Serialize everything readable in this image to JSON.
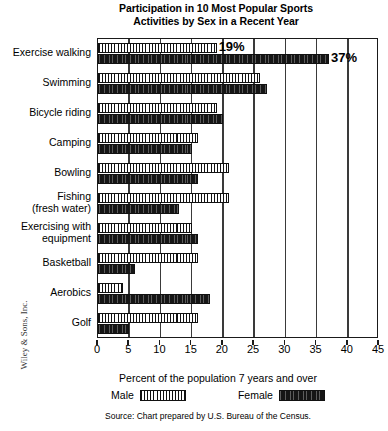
{
  "title_line1": "Participation in 10 Most Popular Sports",
  "title_line2": "Activities by Sex in a Recent Year",
  "axis": {
    "xlabel": "Percent of the population 7 years and over",
    "ticks": [
      "0",
      "5",
      "10",
      "15",
      "20",
      "25",
      "30",
      "35",
      "40",
      "45"
    ]
  },
  "legend": {
    "male_label": "Male",
    "female_label": "Female"
  },
  "source": "Source: Chart prepared by U.S. Bureau of the Census.",
  "credit": "Wiley & Sons, Inc.",
  "annotations": {
    "male_walking": "19%",
    "female_walking": "37%"
  },
  "categories_display": [
    {
      "line1": "Exercise walking",
      "line2": ""
    },
    {
      "line1": "Swimming",
      "line2": ""
    },
    {
      "line1": "Bicycle riding",
      "line2": ""
    },
    {
      "line1": "Camping",
      "line2": ""
    },
    {
      "line1": "Bowling",
      "line2": ""
    },
    {
      "line1": "Fishing",
      "line2": "(fresh water)"
    },
    {
      "line1": "Exercising with",
      "line2": "equipment"
    },
    {
      "line1": "Basketball",
      "line2": ""
    },
    {
      "line1": "Aerobics",
      "line2": ""
    },
    {
      "line1": "Golf",
      "line2": ""
    }
  ],
  "chart_data": {
    "type": "bar",
    "orientation": "horizontal",
    "title": "Participation in 10 Most Popular Sports Activities by Sex in a Recent Year",
    "xlabel": "Percent of the population 7 years and over",
    "ylabel": "",
    "xlim": [
      0,
      45
    ],
    "xticks": [
      0,
      5,
      10,
      15,
      20,
      25,
      30,
      35,
      40,
      45
    ],
    "grid": true,
    "legend_position": "bottom",
    "categories": [
      "Exercise walking",
      "Swimming",
      "Bicycle riding",
      "Camping",
      "Bowling",
      "Fishing (fresh water)",
      "Exercising with equipment",
      "Basketball",
      "Aerobics",
      "Golf"
    ],
    "series": [
      {
        "name": "Male",
        "values": [
          19,
          26,
          19,
          16,
          21,
          21,
          15,
          16,
          4,
          16
        ]
      },
      {
        "name": "Female",
        "values": [
          37,
          27,
          20,
          15,
          16,
          13,
          16,
          6,
          18,
          5
        ]
      }
    ],
    "data_labels": [
      {
        "series": "Male",
        "category": "Exercise walking",
        "text": "19%"
      },
      {
        "series": "Female",
        "category": "Exercise walking",
        "text": "37%"
      }
    ]
  }
}
